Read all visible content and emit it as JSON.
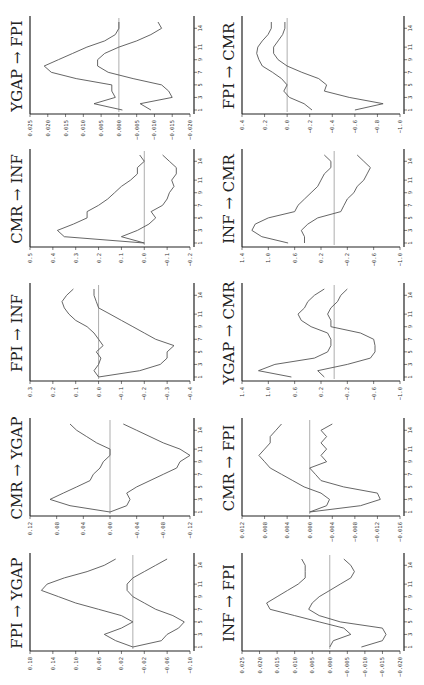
{
  "chart_data": [
    {
      "type": "line",
      "title": "YGAP → FPI",
      "xlabel": "period",
      "x_ticks": [
        "1",
        "3",
        "5",
        "7",
        "9",
        "11",
        "14"
      ],
      "y_ticks": [
        "0.025",
        "0.020",
        "0.015",
        "0.010",
        "0.005",
        "0.000",
        "-0.005",
        "-0.010",
        "-0.015",
        "-0.020"
      ],
      "ylim": [
        -0.02,
        0.025
      ],
      "series": [
        {
          "name": "upper",
          "values": [
            -0.001,
            0.007,
            0.001,
            0.002,
            0.002,
            0.012,
            0.019,
            0.021,
            0.017,
            0.013,
            0.009,
            0.004,
            0.001,
            0.0,
            0.0
          ]
        },
        {
          "name": "lower",
          "values": [
            -0.009,
            -0.006,
            -0.015,
            -0.014,
            -0.012,
            -0.004,
            0.003,
            0.006,
            0.006,
            0.004,
            0.0,
            -0.005,
            -0.009,
            -0.012,
            -0.011
          ]
        }
      ]
    },
    {
      "type": "line",
      "title": "FPI → CMR",
      "xlabel": "period",
      "x_ticks": [
        "1",
        "3",
        "5",
        "7",
        "9",
        "11",
        "14"
      ],
      "y_ticks": [
        "0.4",
        "0.2",
        "0.0",
        "-0.2",
        "-0.4",
        "-0.6",
        "-0.8",
        "-1.0"
      ],
      "ylim": [
        -1.0,
        0.4
      ],
      "series": [
        {
          "name": "upper",
          "values": [
            -0.22,
            -0.15,
            -0.02,
            0.03,
            0.0,
            0.05,
            0.13,
            0.22,
            0.25,
            0.27,
            0.26,
            0.22,
            0.17,
            0.14,
            0.14
          ]
        },
        {
          "name": "lower",
          "values": [
            -0.6,
            -0.85,
            -0.55,
            -0.33,
            -0.35,
            -0.28,
            -0.13,
            0.0,
            0.08,
            0.12,
            0.12,
            0.08,
            0.04,
            0.02,
            0.02
          ]
        }
      ]
    },
    {
      "type": "line",
      "title": "CMR → INF",
      "xlabel": "period",
      "x_ticks": [
        "1",
        "3",
        "5",
        "7",
        "9",
        "11",
        "14"
      ],
      "y_ticks": [
        "0.5",
        "0.4",
        "0.3",
        "0.2",
        "0.1",
        "0.0",
        "-0.1",
        "-0.2"
      ],
      "ylim": [
        -0.2,
        0.5
      ],
      "series": [
        {
          "name": "upper",
          "values": [
            0.0,
            0.35,
            0.38,
            0.31,
            0.25,
            0.25,
            0.2,
            0.16,
            0.13,
            0.1,
            0.06,
            0.03,
            0.03,
            0.0,
            0.02
          ]
        },
        {
          "name": "lower",
          "values": [
            0.0,
            0.1,
            0.03,
            -0.02,
            -0.05,
            -0.03,
            -0.08,
            -0.1,
            -0.11,
            -0.13,
            -0.12,
            -0.14,
            -0.14,
            -0.11,
            -0.08
          ]
        }
      ]
    },
    {
      "type": "line",
      "title": "INF → CMR",
      "xlabel": "period",
      "x_ticks": [
        "1",
        "3",
        "5",
        "7",
        "9",
        "11",
        "14"
      ],
      "y_ticks": [
        "1.4",
        "1.0",
        "0.6",
        "0.2",
        "-0.2",
        "-0.6",
        "-1.0"
      ],
      "ylim": [
        -1.0,
        1.4
      ],
      "series": [
        {
          "name": "upper",
          "values": [
            0.7,
            1.1,
            1.25,
            1.2,
            1.0,
            0.6,
            0.55,
            0.45,
            0.35,
            0.25,
            0.2,
            0.15,
            0.05,
            0.05,
            0.15
          ]
        },
        {
          "name": "lower",
          "values": [
            0.45,
            0.45,
            0.5,
            0.4,
            0.25,
            -0.1,
            -0.15,
            -0.2,
            -0.3,
            -0.35,
            -0.45,
            -0.5,
            -0.55,
            -0.45,
            -0.35
          ]
        }
      ]
    },
    {
      "type": "line",
      "title": "FPI → INF",
      "xlabel": "period",
      "x_ticks": [
        "1",
        "3",
        "5",
        "7",
        "9",
        "11",
        "14"
      ],
      "y_ticks": [
        "0.3",
        "0.2",
        "0.1",
        "0.0",
        "-0.1",
        "-0.2",
        "-0.3",
        "-0.4"
      ],
      "ylim": [
        -0.4,
        0.3
      ],
      "series": [
        {
          "name": "upper",
          "values": [
            0.0,
            0.02,
            0.0,
            -0.01,
            0.01,
            -0.02,
            0.0,
            0.02,
            0.05,
            0.1,
            0.13,
            0.15,
            0.16,
            0.14,
            0.11
          ]
        },
        {
          "name": "lower",
          "values": [
            0.0,
            -0.18,
            -0.27,
            -0.3,
            -0.3,
            -0.33,
            -0.25,
            -0.2,
            -0.15,
            -0.1,
            -0.05,
            0.0,
            0.01,
            0.02,
            0.02
          ]
        }
      ]
    },
    {
      "type": "line",
      "title": "YGAP → CMR",
      "xlabel": "period",
      "x_ticks": [
        "1",
        "3",
        "5",
        "7",
        "9",
        "11",
        "14"
      ],
      "y_ticks": [
        "1.4",
        "1.0",
        "0.6",
        "0.2",
        "-0.2",
        "-0.6",
        "-1.0"
      ],
      "ylim": [
        -1.0,
        1.4
      ],
      "series": [
        {
          "name": "upper",
          "values": [
            0.65,
            1.15,
            0.9,
            0.3,
            0.1,
            0.05,
            0.05,
            0.1,
            0.35,
            0.5,
            0.55,
            0.45,
            0.4,
            0.3,
            0.15
          ]
        },
        {
          "name": "lower",
          "values": [
            0.15,
            0.25,
            -0.2,
            -0.55,
            -0.62,
            -0.62,
            -0.6,
            -0.4,
            0.05,
            0.05,
            0.1,
            0.05,
            -0.05,
            -0.1,
            -0.2
          ]
        }
      ]
    },
    {
      "type": "line",
      "title": "CMR → YGAP",
      "xlabel": "period",
      "x_ticks": [
        "1",
        "3",
        "5",
        "7",
        "9",
        "11",
        "14"
      ],
      "y_ticks": [
        "0.12",
        "0.08",
        "0.04",
        "0.00",
        "-0.04",
        "-0.08",
        "-0.12"
      ],
      "ylim": [
        -0.12,
        0.12
      ],
      "series": [
        {
          "name": "upper",
          "values": [
            0.0,
            0.06,
            0.09,
            0.07,
            0.05,
            0.03,
            0.025,
            0.015,
            0.01,
            0.0,
            0.0,
            0.02,
            0.035,
            0.05,
            0.06
          ]
        },
        {
          "name": "lower",
          "values": [
            0.0,
            -0.025,
            -0.03,
            -0.025,
            -0.04,
            -0.06,
            -0.08,
            -0.1,
            -0.105,
            -0.12,
            -0.105,
            -0.08,
            -0.06,
            -0.04,
            -0.02
          ]
        }
      ]
    },
    {
      "type": "line",
      "title": "CMR → FPI",
      "xlabel": "period",
      "x_ticks": [
        "1",
        "3",
        "5",
        "7",
        "9",
        "11",
        "14"
      ],
      "y_ticks": [
        "0.012",
        "0.008",
        "0.004",
        "0.000",
        "-0.004",
        "-0.008",
        "-0.012",
        "-0.016"
      ],
      "ylim": [
        -0.016,
        0.012
      ],
      "series": [
        {
          "name": "upper",
          "values": [
            0.0,
            -0.003,
            -0.0035,
            -0.002,
            0.001,
            0.003,
            0.005,
            0.007,
            0.008,
            0.009,
            0.008,
            0.007,
            0.007,
            0.006,
            0.005
          ]
        },
        {
          "name": "lower",
          "values": [
            0.0,
            -0.009,
            -0.0125,
            -0.012,
            -0.006,
            -0.002,
            -0.001,
            0.0,
            -0.003,
            -0.002,
            -0.003,
            -0.002,
            -0.003,
            -0.002,
            -0.004
          ]
        }
      ]
    },
    {
      "type": "line",
      "title": "FPI → YGAP",
      "xlabel": "period",
      "x_ticks": [
        "1",
        "3",
        "5",
        "7",
        "9",
        "11",
        "14"
      ],
      "y_ticks": [
        "0.18",
        "0.14",
        "0.10",
        "0.06",
        "0.02",
        "-0.02",
        "-0.06",
        "-0.10"
      ],
      "ylim": [
        -0.1,
        0.18
      ],
      "series": [
        {
          "name": "upper",
          "values": [
            0.0,
            0.03,
            0.05,
            0.02,
            0.0,
            0.02,
            0.06,
            0.1,
            0.13,
            0.16,
            0.15,
            0.12,
            0.08,
            0.05,
            0.03
          ]
        },
        {
          "name": "lower",
          "values": [
            0.0,
            -0.05,
            -0.06,
            -0.08,
            -0.09,
            -0.07,
            -0.04,
            -0.02,
            0.0,
            0.01,
            0.01,
            0.0,
            -0.02,
            -0.04,
            -0.06
          ]
        }
      ]
    },
    {
      "type": "line",
      "title": "INF → FPI",
      "xlabel": "period",
      "x_ticks": [
        "1",
        "3",
        "5",
        "7",
        "9",
        "11",
        "14"
      ],
      "y_ticks": [
        "0.025",
        "0.020",
        "0.015",
        "0.010",
        "0.005",
        "0.000",
        "-0.005",
        "-0.010",
        "-0.015",
        "-0.020"
      ],
      "ylim": [
        -0.02,
        0.025
      ],
      "series": [
        {
          "name": "upper",
          "values": [
            0.0,
            -0.001,
            -0.006,
            -0.004,
            0.003,
            0.01,
            0.017,
            0.018,
            0.015,
            0.012,
            0.009,
            0.007,
            0.007,
            0.007,
            0.008
          ]
        },
        {
          "name": "lower",
          "values": [
            -0.009,
            -0.015,
            -0.016,
            -0.015,
            -0.003,
            0.003,
            0.006,
            0.005,
            0.003,
            0.0,
            -0.003,
            -0.006,
            -0.007,
            -0.006,
            -0.004
          ]
        }
      ]
    }
  ],
  "panels_layout": [
    [
      "YGAP → FPI",
      "FPI → CMR"
    ],
    [
      "CMR → INF",
      "INF → CMR"
    ],
    [
      "FPI → INF",
      "YGAP → CMR"
    ],
    [
      "CMR → YGAP",
      "CMR → FPI"
    ],
    [
      "FPI → YGAP",
      "INF → FPI"
    ]
  ]
}
